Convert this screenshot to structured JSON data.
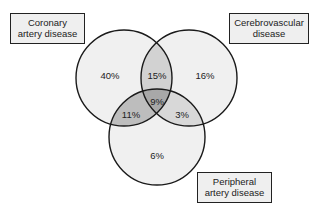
{
  "diagram": {
    "type": "venn",
    "sets": [
      {
        "id": "coronary",
        "label_line1": "Coronary",
        "label_line2": "artery disease"
      },
      {
        "id": "cerebrovascular",
        "label_line1": "Cerebrovascular",
        "label_line2": "disease"
      },
      {
        "id": "peripheral",
        "label_line1": "Peripheral",
        "label_line2": "artery disease"
      }
    ],
    "regions": {
      "coronary_only": "40%",
      "cerebrovascular_only": "16%",
      "peripheral_only": "6%",
      "coronary_cerebrovascular": "15%",
      "coronary_peripheral": "11%",
      "cerebrovascular_peripheral": "3%",
      "all_three": "9%"
    },
    "colors": {
      "single": "#f0f0f0",
      "double": "#d2d2d2",
      "triple": "#a8a8a8",
      "stroke": "#1a1a1a"
    }
  }
}
